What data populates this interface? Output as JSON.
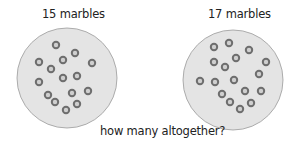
{
  "groups": [
    {
      "label": "15 marbles",
      "count": 15,
      "circle": {
        "cx": 67,
        "cy": 78,
        "r": 50
      },
      "marbles": [
        [
          56,
          45
        ],
        [
          75,
          53
        ],
        [
          39,
          62
        ],
        [
          63,
          60
        ],
        [
          92,
          63
        ],
        [
          51,
          69
        ],
        [
          63,
          78
        ],
        [
          77,
          76
        ],
        [
          39,
          82
        ],
        [
          48,
          95
        ],
        [
          72,
          93
        ],
        [
          88,
          91
        ],
        [
          55,
          102
        ],
        [
          77,
          104
        ],
        [
          66,
          110
        ]
      ]
    },
    {
      "label": "17 marbles",
      "count": 17,
      "circle": {
        "cx": 233,
        "cy": 80,
        "r": 50
      },
      "marbles": [
        [
          229,
          43
        ],
        [
          214,
          47
        ],
        [
          249,
          50
        ],
        [
          236,
          58
        ],
        [
          214,
          62
        ],
        [
          266,
          62
        ],
        [
          225,
          67
        ],
        [
          259,
          74
        ],
        [
          200,
          81
        ],
        [
          215,
          82
        ],
        [
          234,
          80
        ],
        [
          245,
          91
        ],
        [
          261,
          91
        ],
        [
          222,
          94
        ],
        [
          230,
          102
        ],
        [
          251,
          103
        ],
        [
          240,
          109
        ]
      ]
    }
  ],
  "question": "how many altogether?",
  "colors": {
    "circle_fill": "#e4e4e4",
    "circle_stroke": "#9a9a9a",
    "marble_ring": "#6e6e6e",
    "marble_center": "#cfcfcf",
    "text": "#222222"
  }
}
